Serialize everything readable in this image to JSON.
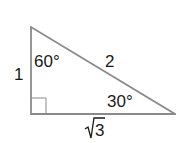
{
  "diagram": {
    "type": "right-triangle",
    "sides": {
      "short_leg": "1",
      "hypotenuse": "2",
      "long_leg": "3"
    },
    "angles": {
      "top": "60°",
      "right": "30°"
    },
    "colors": {
      "stroke": "#8a8a8a",
      "text": "#1a1a1a"
    }
  }
}
